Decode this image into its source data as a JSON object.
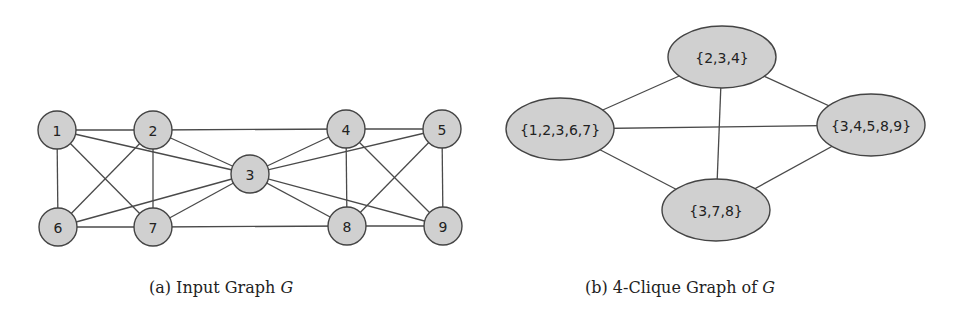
{
  "figure_a": {
    "caption_prefix": "(a) Input Graph ",
    "caption_var": "G",
    "nodes": [
      {
        "id": "1",
        "x": 57,
        "y": 130
      },
      {
        "id": "2",
        "x": 153,
        "y": 130
      },
      {
        "id": "3",
        "x": 250,
        "y": 174
      },
      {
        "id": "4",
        "x": 346,
        "y": 129
      },
      {
        "id": "5",
        "x": 442,
        "y": 129
      },
      {
        "id": "6",
        "x": 58,
        "y": 227
      },
      {
        "id": "7",
        "x": 153,
        "y": 227
      },
      {
        "id": "8",
        "x": 347,
        "y": 226
      },
      {
        "id": "9",
        "x": 443,
        "y": 226
      }
    ],
    "edges": [
      [
        "1",
        "2"
      ],
      [
        "1",
        "3"
      ],
      [
        "1",
        "6"
      ],
      [
        "1",
        "7"
      ],
      [
        "2",
        "3"
      ],
      [
        "2",
        "4"
      ],
      [
        "2",
        "6"
      ],
      [
        "2",
        "7"
      ],
      [
        "3",
        "4"
      ],
      [
        "3",
        "5"
      ],
      [
        "3",
        "6"
      ],
      [
        "3",
        "7"
      ],
      [
        "3",
        "8"
      ],
      [
        "3",
        "9"
      ],
      [
        "4",
        "5"
      ],
      [
        "4",
        "8"
      ],
      [
        "4",
        "9"
      ],
      [
        "5",
        "8"
      ],
      [
        "5",
        "9"
      ],
      [
        "6",
        "7"
      ],
      [
        "7",
        "8"
      ],
      [
        "8",
        "9"
      ]
    ],
    "node_radius": 19
  },
  "figure_b": {
    "caption_prefix": "(b) 4-Clique Graph of ",
    "caption_var": "G",
    "nodes": [
      {
        "id": "c234",
        "label": "{2,3,4}",
        "x": 722,
        "y": 57
      },
      {
        "id": "c12367",
        "label": "{1,2,3,6,7}",
        "x": 560,
        "y": 129
      },
      {
        "id": "c34589",
        "label": "{3,4,5,8,9}",
        "x": 871,
        "y": 125
      },
      {
        "id": "c378",
        "label": "{3,7,8}",
        "x": 716,
        "y": 210
      }
    ],
    "edges": [
      [
        "c234",
        "c12367"
      ],
      [
        "c234",
        "c34589"
      ],
      [
        "c234",
        "c378"
      ],
      [
        "c12367",
        "c34589"
      ],
      [
        "c12367",
        "c378"
      ],
      [
        "c34589",
        "c378"
      ]
    ],
    "rx": 54,
    "ry": 31
  },
  "colors": {
    "node_fill": "#d0d0d0",
    "node_stroke": "#444444",
    "edge": "#4a4a4a",
    "text": "#222222"
  }
}
